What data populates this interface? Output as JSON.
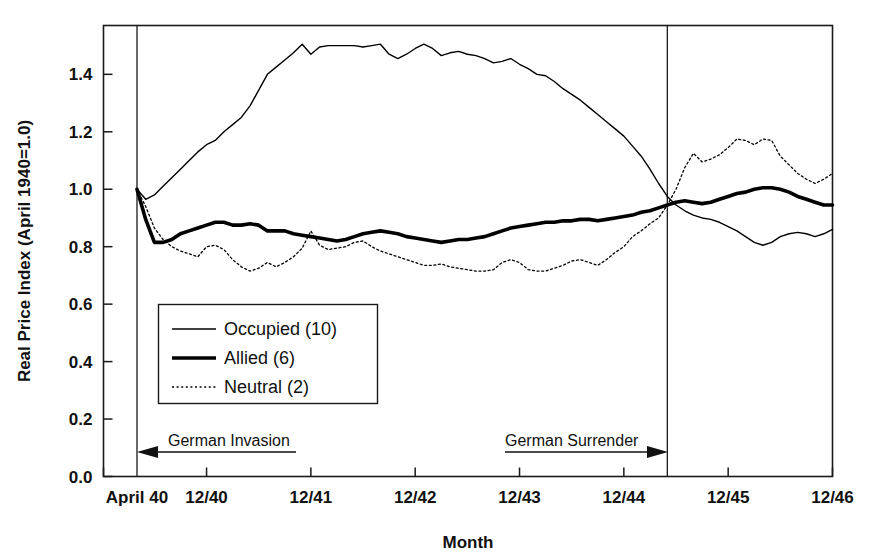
{
  "chart_data": {
    "type": "line",
    "title": "",
    "xlabel": "Month",
    "ylabel": "Real Price Index (April 1940=1.0)",
    "ylim": [
      0.0,
      1.57
    ],
    "xlim": [
      0,
      80
    ],
    "grid": false,
    "legend_position": "inside-lower-left",
    "ytick_labels": [
      "0.0",
      "0.2",
      "0.4",
      "0.6",
      "0.8",
      "1.0",
      "1.2",
      "1.4"
    ],
    "ytick_values": [
      0.0,
      0.2,
      0.4,
      0.6,
      0.8,
      1.0,
      1.2,
      1.4
    ],
    "xtick_labels": [
      "April 40",
      "12/40",
      "12/41",
      "12/42",
      "12/43",
      "12/44",
      "12/45",
      "12/46"
    ],
    "xtick_values": [
      0,
      8,
      20,
      32,
      44,
      56,
      68,
      80
    ],
    "annotations": [
      {
        "name": "german-invasion",
        "text": "German Invasion",
        "direction": "left",
        "x_start": 0,
        "x_end": 18,
        "y": 0.12
      },
      {
        "name": "german-surrender",
        "text": "German Surrender",
        "direction": "right",
        "x_start": 42,
        "x_end": 61,
        "y": 0.12
      }
    ],
    "event_lines": [
      {
        "name": "april-1940-invasion-line",
        "x": 0
      },
      {
        "name": "may-1945-surrender-line",
        "x": 61
      }
    ],
    "series": [
      {
        "name": "Occupied (10)",
        "label": "Occupied (10)",
        "count": 10,
        "style": "solid-thin",
        "color": "#000000",
        "width": 1.4,
        "x": [
          0,
          1,
          2,
          3,
          4,
          5,
          6,
          7,
          8,
          9,
          10,
          11,
          12,
          13,
          14,
          15,
          16,
          17,
          18,
          19,
          20,
          21,
          22,
          23,
          24,
          25,
          26,
          27,
          28,
          29,
          30,
          31,
          32,
          33,
          34,
          35,
          36,
          37,
          38,
          39,
          40,
          41,
          42,
          43,
          44,
          45,
          46,
          47,
          48,
          49,
          50,
          51,
          52,
          53,
          54,
          55,
          56,
          57,
          58,
          59,
          60,
          61,
          62,
          63,
          64,
          65,
          66,
          67,
          68,
          69,
          70,
          71,
          72,
          73,
          74,
          75,
          76,
          77,
          78,
          79,
          80
        ],
        "y": [
          1.0,
          0.965,
          0.98,
          1.01,
          1.04,
          1.07,
          1.1,
          1.13,
          1.155,
          1.17,
          1.2,
          1.225,
          1.25,
          1.29,
          1.345,
          1.4,
          1.425,
          1.45,
          1.475,
          1.505,
          1.47,
          1.495,
          1.5,
          1.5,
          1.5,
          1.5,
          1.495,
          1.5,
          1.505,
          1.47,
          1.455,
          1.47,
          1.49,
          1.505,
          1.49,
          1.465,
          1.475,
          1.48,
          1.47,
          1.465,
          1.455,
          1.44,
          1.445,
          1.455,
          1.435,
          1.42,
          1.4,
          1.395,
          1.375,
          1.35,
          1.33,
          1.31,
          1.285,
          1.26,
          1.235,
          1.21,
          1.185,
          1.15,
          1.115,
          1.07,
          1.02,
          0.975,
          0.945,
          0.925,
          0.91,
          0.9,
          0.895,
          0.885,
          0.87,
          0.855,
          0.835,
          0.815,
          0.805,
          0.815,
          0.835,
          0.845,
          0.85,
          0.845,
          0.835,
          0.845,
          0.86
        ]
      },
      {
        "name": "Allied (6)",
        "label": "Allied (6)",
        "count": 6,
        "style": "solid-thick",
        "color": "#000000",
        "width": 3.6,
        "x": [
          0,
          1,
          2,
          3,
          4,
          5,
          6,
          7,
          8,
          9,
          10,
          11,
          12,
          13,
          14,
          15,
          16,
          17,
          18,
          19,
          20,
          21,
          22,
          23,
          24,
          25,
          26,
          27,
          28,
          29,
          30,
          31,
          32,
          33,
          34,
          35,
          36,
          37,
          38,
          39,
          40,
          41,
          42,
          43,
          44,
          45,
          46,
          47,
          48,
          49,
          50,
          51,
          52,
          53,
          54,
          55,
          56,
          57,
          58,
          59,
          60,
          61,
          62,
          63,
          64,
          65,
          66,
          67,
          68,
          69,
          70,
          71,
          72,
          73,
          74,
          75,
          76,
          77,
          78,
          79,
          80
        ],
        "y": [
          1.0,
          0.895,
          0.815,
          0.815,
          0.825,
          0.845,
          0.855,
          0.865,
          0.875,
          0.885,
          0.885,
          0.875,
          0.875,
          0.88,
          0.875,
          0.855,
          0.855,
          0.855,
          0.845,
          0.84,
          0.835,
          0.83,
          0.825,
          0.82,
          0.825,
          0.835,
          0.845,
          0.85,
          0.855,
          0.85,
          0.845,
          0.835,
          0.83,
          0.825,
          0.82,
          0.815,
          0.82,
          0.825,
          0.825,
          0.83,
          0.835,
          0.845,
          0.855,
          0.865,
          0.87,
          0.875,
          0.88,
          0.885,
          0.885,
          0.89,
          0.89,
          0.895,
          0.895,
          0.89,
          0.895,
          0.9,
          0.905,
          0.91,
          0.92,
          0.925,
          0.935,
          0.945,
          0.955,
          0.96,
          0.955,
          0.95,
          0.955,
          0.965,
          0.975,
          0.985,
          0.99,
          1.0,
          1.005,
          1.005,
          1.0,
          0.99,
          0.975,
          0.965,
          0.955,
          0.945,
          0.945
        ]
      },
      {
        "name": "Neutral (2)",
        "label": "Neutral (2)",
        "count": 2,
        "style": "dotted",
        "color": "#000000",
        "width": 1.3,
        "x": [
          0,
          1,
          2,
          3,
          4,
          5,
          6,
          7,
          8,
          9,
          10,
          11,
          12,
          13,
          14,
          15,
          16,
          17,
          18,
          19,
          20,
          21,
          22,
          23,
          24,
          25,
          26,
          27,
          28,
          29,
          30,
          31,
          32,
          33,
          34,
          35,
          36,
          37,
          38,
          39,
          40,
          41,
          42,
          43,
          44,
          45,
          46,
          47,
          48,
          49,
          50,
          51,
          52,
          53,
          54,
          55,
          56,
          57,
          58,
          59,
          60,
          61,
          62,
          63,
          64,
          65,
          66,
          67,
          68,
          69,
          70,
          71,
          72,
          73,
          74,
          75,
          76,
          77,
          78,
          79,
          80
        ],
        "y": [
          1.0,
          0.94,
          0.865,
          0.825,
          0.8,
          0.785,
          0.775,
          0.765,
          0.8,
          0.805,
          0.79,
          0.755,
          0.73,
          0.715,
          0.725,
          0.745,
          0.73,
          0.745,
          0.765,
          0.795,
          0.855,
          0.805,
          0.79,
          0.795,
          0.8,
          0.815,
          0.82,
          0.8,
          0.785,
          0.775,
          0.765,
          0.755,
          0.745,
          0.735,
          0.735,
          0.74,
          0.73,
          0.725,
          0.72,
          0.715,
          0.715,
          0.72,
          0.745,
          0.755,
          0.745,
          0.72,
          0.715,
          0.715,
          0.725,
          0.735,
          0.75,
          0.755,
          0.745,
          0.735,
          0.755,
          0.78,
          0.8,
          0.835,
          0.855,
          0.88,
          0.9,
          0.945,
          1.0,
          1.075,
          1.125,
          1.095,
          1.105,
          1.12,
          1.145,
          1.175,
          1.17,
          1.155,
          1.175,
          1.17,
          1.115,
          1.085,
          1.055,
          1.035,
          1.02,
          1.035,
          1.055
        ]
      }
    ]
  },
  "axes": {
    "y_title": "Real Price Index (April 1940=1.0)",
    "x_title": "Month"
  }
}
